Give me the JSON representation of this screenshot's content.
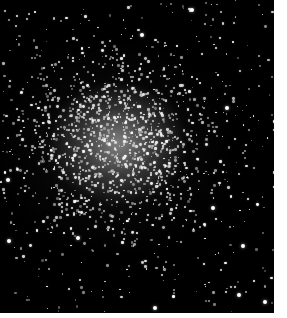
{
  "image": {
    "subject": "Globular star cluster",
    "description": "Dense spherical cluster of white stars on black sky, core slightly left of center",
    "background_color": "#000000",
    "core_center": [
      118,
      143
    ],
    "frame": {
      "width": 274,
      "height": 313
    },
    "page_background": "#ffffff"
  },
  "stars": {
    "seed": 42,
    "core_count": 1100,
    "field_count": 420,
    "bright": [
      [
        142,
        35
      ],
      [
        213,
        208
      ],
      [
        227,
        108
      ],
      [
        265,
        302
      ],
      [
        239,
        295
      ],
      [
        9,
        241
      ],
      [
        78,
        238
      ],
      [
        243,
        246
      ],
      [
        192,
        10
      ],
      [
        8,
        180
      ],
      [
        155,
        308
      ]
    ]
  }
}
